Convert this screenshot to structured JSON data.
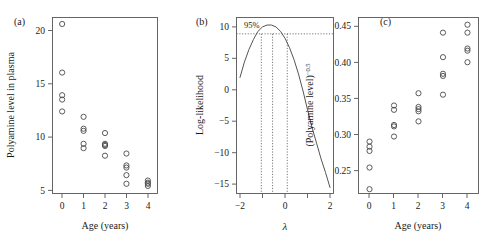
{
  "figure": {
    "panels": [
      {
        "tag": "(a)",
        "ylabel": "Polyamine level in plasma",
        "xlabel": "Age (years)",
        "xticks": [
          "0",
          "1",
          "2",
          "3",
          "4"
        ],
        "yticks": [
          "5",
          "10",
          "15",
          "20"
        ]
      },
      {
        "tag": "(b)",
        "ylabel": "Log-likelihood",
        "xlabel": "λ",
        "xticks": [
          "−2",
          "0",
          "2"
        ],
        "yticks": [
          "−15",
          "−10",
          "−5",
          "0",
          "5",
          "10"
        ],
        "ci_label": "95%"
      },
      {
        "tag": "(c)",
        "ylabel_base": "(Polyamine level)",
        "ylabel_exp": "−0.5",
        "xlabel": "Age (years)",
        "xticks": [
          "0",
          "1",
          "2",
          "3",
          "4"
        ],
        "yticks": [
          "0.25",
          "0.30",
          "0.35",
          "0.40",
          "0.45"
        ]
      }
    ]
  },
  "chart_data": [
    {
      "type": "scatter",
      "title": "(a)",
      "xlabel": "Age (years)",
      "ylabel": "Polyamine level in plasma",
      "xlim": [
        -0.45,
        4.45
      ],
      "ylim": [
        4.3,
        20.6
      ],
      "xticks": [
        0,
        1,
        2,
        3,
        4
      ],
      "yticks": [
        5,
        10,
        15,
        20
      ],
      "grid": false,
      "marker": "open-circle",
      "x": [
        0,
        0,
        0,
        0,
        0,
        1,
        1,
        1,
        1,
        1,
        2,
        2,
        2,
        2,
        2,
        3,
        3,
        3,
        3,
        3,
        4,
        4,
        4,
        4
      ],
      "y": [
        20.0,
        15.5,
        13.4,
        13.0,
        11.9,
        11.4,
        10.3,
        10.1,
        8.9,
        8.5,
        9.9,
        8.9,
        8.8,
        8.7,
        7.8,
        8.0,
        6.9,
        6.7,
        6.0,
        5.2,
        5.5,
        5.3,
        5.2,
        5.0
      ]
    },
    {
      "type": "line",
      "title": "(b)",
      "xlabel": "λ",
      "ylabel": "Log-likelihood",
      "xlim": [
        -2.15,
        2.15
      ],
      "ylim": [
        -16.5,
        11.5
      ],
      "xticks": [
        -2,
        0,
        2
      ],
      "xminorticks": [
        -1,
        1
      ],
      "yticks": [
        -15,
        -10,
        -5,
        0,
        5,
        10
      ],
      "grid": false,
      "annotation": "95%",
      "ci_hline_y": 8.9,
      "vlines": [
        -1.05,
        -0.55,
        0.1
      ],
      "mle_lambda": -0.55,
      "max_loglik": 10.3,
      "x": [
        -2.0,
        -1.8,
        -1.6,
        -1.4,
        -1.2,
        -1.0,
        -0.8,
        -0.6,
        -0.4,
        -0.2,
        0.0,
        0.2,
        0.4,
        0.6,
        0.8,
        1.0,
        1.2,
        1.4,
        1.6,
        1.8,
        2.0
      ],
      "y": [
        1.9,
        4.4,
        6.4,
        8.0,
        9.3,
        10.0,
        10.3,
        10.3,
        10.0,
        9.3,
        8.2,
        6.7,
        4.8,
        2.5,
        -0.2,
        -3.2,
        -6.0,
        -8.5,
        -11.0,
        -13.2,
        -15.6
      ]
    },
    {
      "type": "scatter",
      "title": "(c)",
      "xlabel": "Age (years)",
      "ylabel": "(Polyamine level)^-0.5",
      "xlim": [
        -0.45,
        4.45
      ],
      "ylim": [
        0.218,
        0.462
      ],
      "xticks": [
        0,
        1,
        2,
        3,
        4
      ],
      "yticks": [
        0.25,
        0.3,
        0.35,
        0.4,
        0.45
      ],
      "grid": false,
      "marker": "open-circle",
      "x": [
        0,
        0,
        0,
        0,
        0,
        1,
        1,
        1,
        1,
        1,
        2,
        2,
        2,
        2,
        2,
        3,
        3,
        3,
        3,
        3,
        4,
        4,
        4,
        4,
        4
      ],
      "y": [
        0.224,
        0.254,
        0.277,
        0.283,
        0.29,
        0.297,
        0.311,
        0.313,
        0.334,
        0.34,
        0.318,
        0.332,
        0.335,
        0.338,
        0.357,
        0.355,
        0.381,
        0.384,
        0.407,
        0.441,
        0.4,
        0.416,
        0.419,
        0.441,
        0.452
      ]
    }
  ]
}
